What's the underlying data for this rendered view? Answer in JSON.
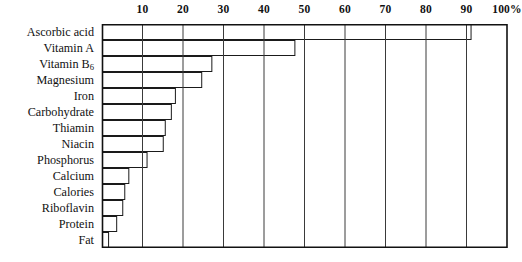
{
  "chart_data": {
    "type": "bar",
    "orientation": "horizontal",
    "title": "",
    "xlabel": "",
    "ylabel": "",
    "xlim": [
      0,
      100
    ],
    "unit": "%",
    "grid": true,
    "legend": null,
    "bar_style": "outline",
    "categories": [
      "Ascorbic acid",
      "Vitamin A",
      "Vitamin B6",
      "Magnesium",
      "Iron",
      "Carbohydrate",
      "Thiamin",
      "Niacin",
      "Phosphorus",
      "Calcium",
      "Calories",
      "Riboflavin",
      "Protein",
      "Fat"
    ],
    "category_labels_html": [
      "Ascorbic acid",
      "Vitamin A",
      "Vitamin B<sub>6</sub>",
      "Magnesium",
      "Iron",
      "Carbohydrate",
      "Thiamin",
      "Niacin",
      "Phosphorus",
      "Calcium",
      "Calories",
      "Riboflavin",
      "Protein",
      "Fat"
    ],
    "values": [
      91,
      47.5,
      27,
      24.5,
      18,
      17,
      15.5,
      15,
      11,
      6.5,
      5.5,
      5,
      3.5,
      1.5
    ],
    "xticks": [
      10,
      20,
      30,
      40,
      50,
      60,
      70,
      80,
      90,
      100
    ],
    "xtick_labels": [
      "10",
      "20",
      "30",
      "40",
      "50",
      "60",
      "70",
      "80",
      "90",
      "100%"
    ],
    "gridlines": [
      10,
      20,
      30,
      40,
      50,
      60,
      70,
      80,
      90,
      100
    ]
  },
  "style": {
    "bar_stroke": "#1a1a1a",
    "bar_fill": "#ffffff",
    "grid_color": "#3a3a3a",
    "frame_color": "#111111",
    "text_color": "#111111",
    "background": "#ffffff"
  }
}
